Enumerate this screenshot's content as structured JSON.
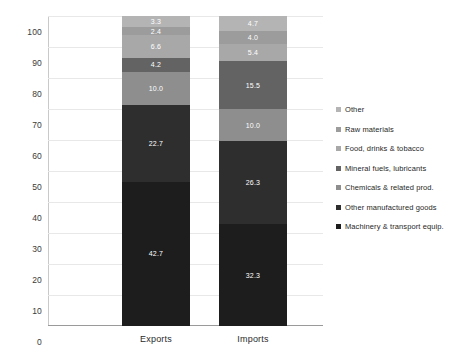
{
  "chart_data": {
    "type": "bar",
    "stacked": true,
    "title": "",
    "xlabel": "",
    "ylabel": "",
    "ylim": [
      0,
      100
    ],
    "yticks": [
      0,
      10,
      20,
      30,
      40,
      50,
      60,
      70,
      80,
      90,
      100
    ],
    "grid": true,
    "legend_position": "right",
    "categories": [
      "Exports",
      "Imports"
    ],
    "series": [
      {
        "name": "Machinery & transport equip.",
        "color": "#1d1d1d",
        "values": [
          42.7,
          32.3
        ]
      },
      {
        "name": "Other manufactured goods",
        "color": "#2e2e2e",
        "values": [
          22.7,
          26.3
        ]
      },
      {
        "name": "Chemicals & related prod.",
        "color": "#8e8e8e",
        "values": [
          10.0,
          10.0
        ]
      },
      {
        "name": "Mineral fuels, lubricants",
        "color": "#636363",
        "values": [
          4.2,
          15.5
        ]
      },
      {
        "name": "Food, drinks & tobacco",
        "color": "#a8a8a8",
        "values": [
          6.6,
          5.4
        ]
      },
      {
        "name": "Raw materials",
        "color": "#9c9c9c",
        "values": [
          2.4,
          4.0
        ]
      },
      {
        "name": "Other",
        "color": "#b4b4b4",
        "values": [
          3.3,
          4.7
        ]
      }
    ],
    "legend_entries": [
      "Other",
      "Raw materials",
      "Food, drinks & tobacco",
      "Mineral fuels, lubricants",
      "Chemicals & related prod.",
      "Other manufactured goods",
      "Machinery & transport equip."
    ]
  }
}
